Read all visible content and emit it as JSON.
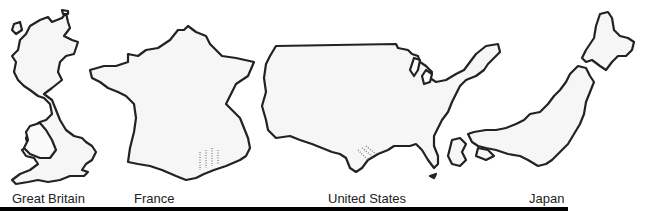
{
  "figure": {
    "countries": [
      {
        "id": "great-britain",
        "label": "Great Britain"
      },
      {
        "id": "france",
        "label": "France"
      },
      {
        "id": "united-states",
        "label": "United States"
      },
      {
        "id": "japan",
        "label": "Japan"
      }
    ],
    "colors": {
      "outline": "#222222",
      "fill": "#f6f6f6",
      "rule": "#000000"
    }
  }
}
